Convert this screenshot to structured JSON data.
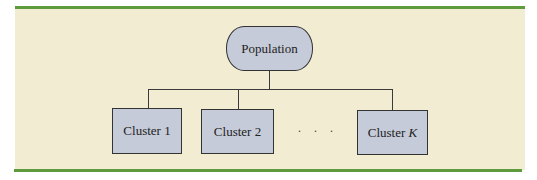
{
  "diagram": {
    "type": "hierarchy",
    "root": {
      "label": "Population"
    },
    "children": [
      {
        "label": "Cluster 1"
      },
      {
        "label": "Cluster 2"
      },
      {
        "label": "Cluster ",
        "label_italic": "K"
      }
    ],
    "ellipsis": ". . .",
    "colors": {
      "panel": "#f1ecd2",
      "accent_bar": "#5d9b3c",
      "node_fill": "#c6cbd9",
      "line": "#3a3a3a"
    }
  }
}
